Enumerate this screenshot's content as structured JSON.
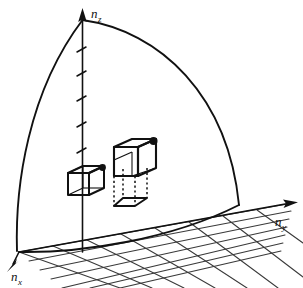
{
  "figure": {
    "background_color": "#ffffff",
    "ink_color": "#111111",
    "grid_color": "#3a3a3a",
    "width": 303,
    "height": 288
  },
  "axes": {
    "z": {
      "name": "n_z",
      "label_base": "n",
      "label_sub": "z",
      "arrow": "up",
      "tick_count": 5
    },
    "y": {
      "name": "n_y",
      "label_base": "n",
      "label_sub": "y",
      "arrow": "right"
    },
    "x": {
      "name": "n_x",
      "label_base": "n",
      "label_sub": "x",
      "arrow": "down-left"
    }
  },
  "shell": {
    "description": "quarter-circle arc boundary of constant n in first octant",
    "left_arc_label": "arc-left",
    "right_arc_label": "arc-right",
    "ground_arc_label": "arc-ground"
  },
  "grid": {
    "description": "perspective mesh in the n_x - n_y plane",
    "lines_along_x": 7,
    "lines_along_y": 8
  },
  "cubes": [
    {
      "name": "small-unit-cell",
      "marker": "state-point-dot",
      "size": "small"
    },
    {
      "name": "large-unit-cell",
      "marker": "state-point-dot",
      "size": "large",
      "has_projection": true,
      "projection_style": "dotted"
    }
  ]
}
